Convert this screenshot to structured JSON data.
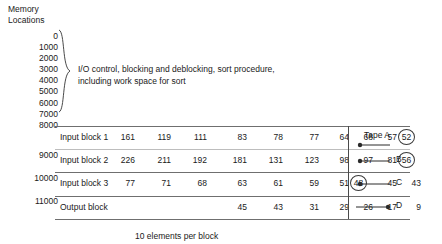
{
  "figure": {
    "memory_heading": "Memory\nLocations",
    "description": "I/O control, blocking and deblocking, sort procedure,\nincluding work space for sort",
    "caption": "10 elements per block",
    "brace_icon": "curly-brace-icon"
  },
  "address_scale": {
    "braced_labels": [
      "0",
      "1000",
      "2000",
      "3000",
      "4000",
      "5000",
      "6000",
      "7000"
    ],
    "unbraced_label": "8000",
    "rule_labels": [
      "9000",
      "10000",
      "11000"
    ]
  },
  "blocks": [
    {
      "label": "Input block 1",
      "values": [
        "161",
        "119",
        "111",
        "83",
        "78",
        "77",
        "64",
        "68",
        "57",
        "52"
      ],
      "circled_index": 9,
      "tape": "Tape A",
      "direction": "in"
    },
    {
      "label": "Input block 2",
      "values": [
        "226",
        "211",
        "192",
        "181",
        "131",
        "123",
        "98",
        "97",
        "81",
        "56"
      ],
      "circled_index": 9,
      "tape": "B",
      "direction": "in"
    },
    {
      "label": "Input block 3",
      "values": [
        "77",
        "71",
        "68",
        "63",
        "61",
        "59",
        "51",
        "48",
        "45",
        "43"
      ],
      "circled_index": 7,
      "tape": "C",
      "direction": "in"
    },
    {
      "label": "Output block",
      "values": [
        "",
        "",
        "",
        "45",
        "43",
        "31",
        "29",
        "26",
        "17",
        "9"
      ],
      "circled_index": -1,
      "tape": "D",
      "direction": "out"
    }
  ],
  "colors": {
    "ink": "#1a1a1a",
    "rule": "#6f6f6f",
    "rule_light": "#bdbdbd",
    "circle": "#3a3a3a"
  }
}
